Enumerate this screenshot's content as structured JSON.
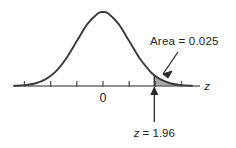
{
  "figure": {
    "background_color": "#ffffff",
    "curve_color": "#3a3a3a",
    "axis_color": "#555555",
    "shade_fill": "#a9a9a9",
    "text_color": "#222222",
    "annotations": {
      "area_label": "Area = 0.025",
      "origin_label": "0",
      "axis_label": "z",
      "z_value_label_var": "z",
      "z_value_label_rest": " = 1.96"
    }
  },
  "chart_data": {
    "type": "area",
    "xlabel": "z",
    "ylabel": "",
    "xlim": [
      -3.4,
      3.4
    ],
    "ylim": [
      0,
      0.42
    ],
    "grid": false,
    "legend": false,
    "distribution": {
      "name": "standard normal",
      "mean": 0,
      "sd": 1,
      "density_formula": "phi(z) = (1/sqrt(2*pi)) * exp(-z^2/2)"
    },
    "tick_labels": [
      "0"
    ],
    "tick_positions_z": [
      -3,
      -2,
      -1,
      0,
      1,
      2,
      3
    ],
    "labeled_ticks": [
      {
        "z": 0,
        "label": "0"
      }
    ],
    "shaded_region": {
      "from_z": 1.96,
      "to_z": 3.4,
      "area": 0.025,
      "label": "Area = 0.025",
      "fill": "#a9a9a9"
    },
    "markers": [
      {
        "z": 1.96,
        "label": "z = 1.96",
        "type": "vertical-arrow-up"
      }
    ],
    "annotations": [
      {
        "text": "Area = 0.025",
        "points_to_z": 2.1,
        "anchor": "upper-right",
        "arrow": true
      },
      {
        "text": "z = 1.96",
        "points_to_z": 1.96,
        "anchor": "below-axis",
        "arrow": true
      }
    ],
    "curve_points": [
      {
        "z": -3.4,
        "density": 0.0012
      },
      {
        "z": -3.0,
        "density": 0.0044
      },
      {
        "z": -2.6,
        "density": 0.0136
      },
      {
        "z": -2.2,
        "density": 0.0355
      },
      {
        "z": -1.8,
        "density": 0.079
      },
      {
        "z": -1.4,
        "density": 0.1497
      },
      {
        "z": -1.0,
        "density": 0.242
      },
      {
        "z": -0.6,
        "density": 0.3332
      },
      {
        "z": -0.2,
        "density": 0.391
      },
      {
        "z": 0.0,
        "density": 0.3989
      },
      {
        "z": 0.2,
        "density": 0.391
      },
      {
        "z": 0.6,
        "density": 0.3332
      },
      {
        "z": 1.0,
        "density": 0.242
      },
      {
        "z": 1.4,
        "density": 0.1497
      },
      {
        "z": 1.8,
        "density": 0.079
      },
      {
        "z": 1.96,
        "density": 0.0584
      },
      {
        "z": 2.2,
        "density": 0.0355
      },
      {
        "z": 2.6,
        "density": 0.0136
      },
      {
        "z": 3.0,
        "density": 0.0044
      },
      {
        "z": 3.4,
        "density": 0.0012
      }
    ]
  }
}
